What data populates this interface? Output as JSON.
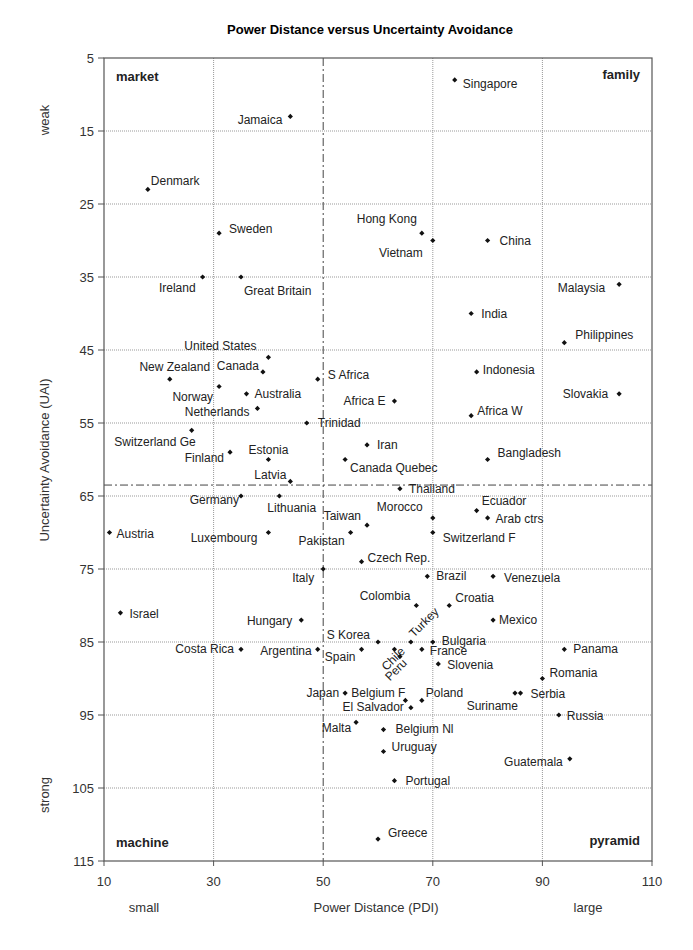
{
  "chart_data": {
    "type": "scatter",
    "title": "Power Distance versus Uncertainty Avoidance",
    "xlabel": "Power Distance (PDI)",
    "ylabel": "Uncertainty Avoidance (UAI)",
    "x_low_label": "small",
    "x_high_label": "large",
    "y_low_label": "weak",
    "y_high_label": "strong",
    "xlim": [
      10,
      110
    ],
    "ylim": [
      5,
      115
    ],
    "y_inverted": true,
    "x_ticks": [
      10,
      30,
      50,
      70,
      90,
      110
    ],
    "y_ticks": [
      5,
      15,
      25,
      35,
      45,
      55,
      65,
      75,
      85,
      95,
      105,
      115
    ],
    "grid": true,
    "reference_lines": {
      "x": 50,
      "y": 63.5,
      "style": "dash-dot"
    },
    "quadrant_labels": [
      {
        "text": "market",
        "pos": "top-left"
      },
      {
        "text": "family",
        "pos": "top-right"
      },
      {
        "text": "machine",
        "pos": "bottom-left"
      },
      {
        "text": "pyramid",
        "pos": "bottom-right"
      }
    ],
    "points": [
      {
        "name": "Singapore",
        "x": 74,
        "y": 8,
        "lx": 8,
        "ly": 8,
        "anchor": "start"
      },
      {
        "name": "Jamaica",
        "x": 44,
        "y": 13,
        "lx": -8,
        "ly": 8,
        "anchor": "end"
      },
      {
        "name": "Denmark",
        "x": 18,
        "y": 23,
        "lx": 3,
        "ly": -4,
        "anchor": "start"
      },
      {
        "name": "Sweden",
        "x": 31,
        "y": 29,
        "lx": 10,
        "ly": 0,
        "anchor": "start"
      },
      {
        "name": "Ireland",
        "x": 28,
        "y": 35,
        "lx": -7,
        "ly": 15,
        "anchor": "end"
      },
      {
        "name": "Great Britain",
        "x": 35,
        "y": 35,
        "lx": 3,
        "ly": 18,
        "anchor": "start"
      },
      {
        "name": "Hong Kong",
        "x": 68,
        "y": 29,
        "lx": -5,
        "ly": -10,
        "anchor": "end"
      },
      {
        "name": "Vietnam",
        "x": 70,
        "y": 30,
        "lx": -10,
        "ly": 16,
        "anchor": "end"
      },
      {
        "name": "China",
        "x": 80,
        "y": 30,
        "lx": 12,
        "ly": 4,
        "anchor": "start"
      },
      {
        "name": "Malaysia",
        "x": 104,
        "y": 36,
        "lx": -14,
        "ly": 8,
        "anchor": "end"
      },
      {
        "name": "India",
        "x": 77,
        "y": 40,
        "lx": 10,
        "ly": 4,
        "anchor": "start"
      },
      {
        "name": "Philippines",
        "x": 94,
        "y": 44,
        "lx": 11,
        "ly": -4,
        "anchor": "start"
      },
      {
        "name": "United States",
        "x": 40,
        "y": 46,
        "lx": -12,
        "ly": -7,
        "anchor": "end"
      },
      {
        "name": "Canada",
        "x": 39,
        "y": 48,
        "lx": -4,
        "ly": -2,
        "anchor": "end"
      },
      {
        "name": "New Zealand",
        "x": 22,
        "y": 49,
        "lx": 5,
        "ly": -8,
        "anchor": "middle"
      },
      {
        "name": "S Africa",
        "x": 49,
        "y": 49,
        "lx": 10,
        "ly": 0,
        "anchor": "start"
      },
      {
        "name": "Indonesia",
        "x": 78,
        "y": 48,
        "lx": 6,
        "ly": 2,
        "anchor": "start"
      },
      {
        "name": "Norway",
        "x": 31,
        "y": 50,
        "lx": -6,
        "ly": 14,
        "anchor": "end"
      },
      {
        "name": "Australia",
        "x": 36,
        "y": 51,
        "lx": 8,
        "ly": 4,
        "anchor": "start"
      },
      {
        "name": "Africa E",
        "x": 63,
        "y": 52,
        "lx": -9,
        "ly": 4,
        "anchor": "end"
      },
      {
        "name": "Slovakia",
        "x": 104,
        "y": 51,
        "lx": -11,
        "ly": 4,
        "anchor": "end"
      },
      {
        "name": "Netherlands",
        "x": 38,
        "y": 53,
        "lx": -8,
        "ly": 8,
        "anchor": "end"
      },
      {
        "name": "Africa W",
        "x": 77,
        "y": 54,
        "lx": 6,
        "ly": -1,
        "anchor": "start"
      },
      {
        "name": "Trinidad",
        "x": 47,
        "y": 55,
        "lx": 11,
        "ly": 4,
        "anchor": "start"
      },
      {
        "name": "Switzerland Ge",
        "x": 26,
        "y": 56,
        "lx": 4,
        "ly": 16,
        "anchor": "end"
      },
      {
        "name": "Finland",
        "x": 33,
        "y": 59,
        "lx": -6,
        "ly": 10,
        "anchor": "end"
      },
      {
        "name": "Estonia",
        "x": 40,
        "y": 60,
        "lx": 0,
        "ly": -6,
        "anchor": "middle"
      },
      {
        "name": "Iran",
        "x": 58,
        "y": 58,
        "lx": 10,
        "ly": 4,
        "anchor": "start"
      },
      {
        "name": "Canada Quebec",
        "x": 54,
        "y": 60,
        "lx": 5,
        "ly": 12,
        "anchor": "start"
      },
      {
        "name": "Bangladesh",
        "x": 80,
        "y": 60,
        "lx": 10,
        "ly": -3,
        "anchor": "start"
      },
      {
        "name": "Latvia",
        "x": 44,
        "y": 63,
        "lx": -4,
        "ly": -2,
        "anchor": "end"
      },
      {
        "name": "Thailand",
        "x": 64,
        "y": 64,
        "lx": 9,
        "ly": 4,
        "anchor": "start"
      },
      {
        "name": "Germany",
        "x": 35,
        "y": 65,
        "lx": -2,
        "ly": 8,
        "anchor": "end"
      },
      {
        "name": "Lithuania",
        "x": 42,
        "y": 65,
        "lx": -12,
        "ly": 16,
        "anchor": "start"
      },
      {
        "name": "Ecuador",
        "x": 78,
        "y": 67,
        "lx": 5,
        "ly": -6,
        "anchor": "start"
      },
      {
        "name": "Arab ctrs",
        "x": 80,
        "y": 68,
        "lx": 8,
        "ly": 5,
        "anchor": "start"
      },
      {
        "name": "Morocco",
        "x": 70,
        "y": 68,
        "lx": -10,
        "ly": -7,
        "anchor": "end"
      },
      {
        "name": "Taiwan",
        "x": 58,
        "y": 69,
        "lx": -6,
        "ly": -5,
        "anchor": "end"
      },
      {
        "name": "Austria",
        "x": 11,
        "y": 70,
        "lx": 7,
        "ly": 5,
        "anchor": "start"
      },
      {
        "name": "Luxembourg",
        "x": 40,
        "y": 70,
        "lx": -11,
        "ly": 9,
        "anchor": "end"
      },
      {
        "name": "Pakistan",
        "x": 55,
        "y": 70,
        "lx": -6,
        "ly": 12,
        "anchor": "end"
      },
      {
        "name": "Switzerland F",
        "x": 70,
        "y": 70,
        "lx": 10,
        "ly": 9,
        "anchor": "start"
      },
      {
        "name": "Czech Rep.",
        "x": 57,
        "y": 74,
        "lx": 6,
        "ly": 0,
        "anchor": "start"
      },
      {
        "name": "Italy",
        "x": 50,
        "y": 75,
        "lx": -9,
        "ly": 13,
        "anchor": "end"
      },
      {
        "name": "Brazil",
        "x": 69,
        "y": 76,
        "lx": 9,
        "ly": 4,
        "anchor": "start"
      },
      {
        "name": "Venezuela",
        "x": 81,
        "y": 76,
        "lx": 11,
        "ly": 6,
        "anchor": "start"
      },
      {
        "name": "Colombia",
        "x": 67,
        "y": 80,
        "lx": -6,
        "ly": -6,
        "anchor": "end"
      },
      {
        "name": "Croatia",
        "x": 73,
        "y": 80,
        "lx": 6,
        "ly": -4,
        "anchor": "start"
      },
      {
        "name": "Israel",
        "x": 13,
        "y": 81,
        "lx": 9,
        "ly": 5,
        "anchor": "start"
      },
      {
        "name": "Hungary",
        "x": 46,
        "y": 82,
        "lx": -9,
        "ly": 5,
        "anchor": "end"
      },
      {
        "name": "Mexico",
        "x": 81,
        "y": 82,
        "lx": 6,
        "ly": 4,
        "anchor": "start"
      },
      {
        "name": "S Korea",
        "x": 60,
        "y": 85,
        "lx": -8,
        "ly": -3,
        "anchor": "end"
      },
      {
        "name": "Turkey",
        "x": 66,
        "y": 85,
        "lx": 3,
        "ly": -4,
        "anchor": "start",
        "rotate": -45
      },
      {
        "name": "Bulgaria",
        "x": 70,
        "y": 85,
        "lx": 9,
        "ly": 3,
        "anchor": "start"
      },
      {
        "name": "Panama",
        "x": 94,
        "y": 86,
        "lx": 9,
        "ly": 4,
        "anchor": "start"
      },
      {
        "name": "Costa Rica",
        "x": 35,
        "y": 86,
        "lx": -7,
        "ly": 4,
        "anchor": "end"
      },
      {
        "name": "Argentina",
        "x": 49,
        "y": 86,
        "lx": -6,
        "ly": 6,
        "anchor": "end"
      },
      {
        "name": "Spain",
        "x": 57,
        "y": 86,
        "lx": -6,
        "ly": 12,
        "anchor": "end"
      },
      {
        "name": "Chile",
        "x": 63,
        "y": 86,
        "lx": -8,
        "ly": 22,
        "anchor": "start",
        "rotate": -45
      },
      {
        "name": "France",
        "x": 68,
        "y": 86,
        "lx": 8,
        "ly": 6,
        "anchor": "start"
      },
      {
        "name": "Peru",
        "x": 64,
        "y": 87,
        "lx": -10,
        "ly": 25,
        "anchor": "start",
        "rotate": -45
      },
      {
        "name": "Slovenia",
        "x": 71,
        "y": 88,
        "lx": 9,
        "ly": 5,
        "anchor": "start"
      },
      {
        "name": "Romania",
        "x": 90,
        "y": 90,
        "lx": 7,
        "ly": -2,
        "anchor": "start"
      },
      {
        "name": "Japan",
        "x": 54,
        "y": 92,
        "lx": -6,
        "ly": 4,
        "anchor": "end"
      },
      {
        "name": "Belgium F",
        "x": 65,
        "y": 93,
        "lx": 0,
        "ly": -3,
        "anchor": "end"
      },
      {
        "name": "Poland",
        "x": 68,
        "y": 93,
        "lx": 4,
        "ly": -3,
        "anchor": "start"
      },
      {
        "name": "Suriname",
        "x": 85,
        "y": 92,
        "lx": 3,
        "ly": 17,
        "anchor": "end"
      },
      {
        "name": "Serbia",
        "x": 86,
        "y": 92,
        "lx": 10,
        "ly": 5,
        "anchor": "start"
      },
      {
        "name": "El Salvador",
        "x": 66,
        "y": 94,
        "lx": -7,
        "ly": 3,
        "anchor": "end"
      },
      {
        "name": "Russia",
        "x": 93,
        "y": 95,
        "lx": 8,
        "ly": 5,
        "anchor": "start"
      },
      {
        "name": "Malta",
        "x": 56,
        "y": 96,
        "lx": -5,
        "ly": 10,
        "anchor": "end"
      },
      {
        "name": "Belgium Nl",
        "x": 61,
        "y": 97,
        "lx": 12,
        "ly": 3,
        "anchor": "start"
      },
      {
        "name": "Uruguay",
        "x": 61,
        "y": 100,
        "lx": 8,
        "ly": -1,
        "anchor": "start"
      },
      {
        "name": "Guatemala",
        "x": 95,
        "y": 101,
        "lx": -7,
        "ly": 7,
        "anchor": "end"
      },
      {
        "name": "Portugal",
        "x": 63,
        "y": 104,
        "lx": 11,
        "ly": 4,
        "anchor": "start"
      },
      {
        "name": "Greece",
        "x": 60,
        "y": 112,
        "lx": 10,
        "ly": -2,
        "anchor": "start"
      }
    ]
  }
}
